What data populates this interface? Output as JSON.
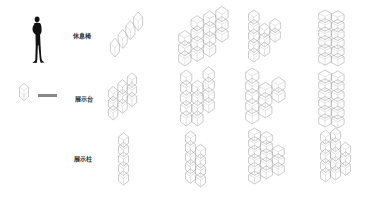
{
  "figure": {
    "scale_figure": {
      "icon": "human-silhouette-icon"
    },
    "legend": {
      "icon": "hexagon-module-icon",
      "text": ""
    },
    "rows": [
      {
        "label": "休息椅",
        "name": "rest-chair",
        "configs": [
          {
            "cols": 1,
            "rows": 4,
            "shape": "single-column-slanted"
          },
          {
            "cols": 4,
            "rows": 4,
            "shape": "block"
          },
          {
            "cols": 2,
            "rows": 5,
            "shape": "v-shape"
          },
          {
            "cols": 2,
            "rows": 6,
            "shape": "double-column"
          }
        ]
      },
      {
        "label": "展示台",
        "name": "display-platform",
        "configs": [
          {
            "cols": 2,
            "rows": 4,
            "shape": "slanted-block"
          },
          {
            "cols": 3,
            "rows": 5,
            "shape": "w-shape"
          },
          {
            "cols": 4,
            "rows": 5,
            "shape": "v-shape"
          },
          {
            "cols": 2,
            "rows": 6,
            "shape": "double-column"
          }
        ]
      },
      {
        "label": "展示柱",
        "name": "display-column",
        "configs": [
          {
            "cols": 1,
            "rows": 5,
            "shape": "single-column"
          },
          {
            "cols": 2,
            "rows": 5,
            "shape": "stepped-column"
          },
          {
            "cols": 3,
            "rows": 6,
            "shape": "l-shape"
          },
          {
            "cols": 3,
            "rows": 5,
            "shape": "stepped-block"
          }
        ]
      }
    ],
    "colors": {
      "line": "#9a9a9a",
      "text": "#333333",
      "silhouette": "#111111",
      "background": "#ffffff"
    }
  }
}
